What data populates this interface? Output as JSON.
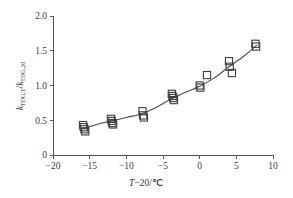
{
  "chart_data": {
    "type": "scatter",
    "title": "",
    "xlabel": "T-20/℃",
    "ylabel": "k(TDG,T) / k(TDG,20)",
    "ylabel_parts": {
      "k1": "k",
      "sub1": "TDG,T",
      "slash": "/",
      "k2": "k",
      "sub2": "TDG,20"
    },
    "xlabel_parts": {
      "var": "T",
      "rest": "−20/℃"
    },
    "xlim": [
      -20,
      10
    ],
    "ylim": [
      0,
      2.0
    ],
    "xticks": [
      -20,
      -15,
      -10,
      -5,
      0,
      5,
      10
    ],
    "xticklabels": [
      "−20",
      "−15",
      "−10",
      "−5",
      "0",
      "5",
      "10"
    ],
    "yticks": [
      0,
      0.5,
      1.0,
      1.5,
      2.0
    ],
    "yticklabels": [
      "0",
      "0.5",
      "1.0",
      "1.5",
      "2.0"
    ],
    "grid": false,
    "legend": null,
    "marker_style": "open-square",
    "series": [
      {
        "name": "measurements",
        "points": [
          [
            -15.9,
            0.43
          ],
          [
            -15.8,
            0.4
          ],
          [
            -15.7,
            0.37
          ],
          [
            -15.6,
            0.34
          ],
          [
            -12.1,
            0.52
          ],
          [
            -12.0,
            0.49
          ],
          [
            -11.9,
            0.46
          ],
          [
            -11.8,
            0.44
          ],
          [
            -7.8,
            0.63
          ],
          [
            -7.7,
            0.57
          ],
          [
            -7.6,
            0.54
          ],
          [
            -3.8,
            0.88
          ],
          [
            -3.7,
            0.85
          ],
          [
            -3.6,
            0.82
          ],
          [
            -3.5,
            0.79
          ],
          [
            0.0,
            1.0
          ],
          [
            0.1,
            0.97
          ],
          [
            1.0,
            1.15
          ],
          [
            4.0,
            1.35
          ],
          [
            4.1,
            1.27
          ],
          [
            4.4,
            1.18
          ],
          [
            7.6,
            1.6
          ],
          [
            7.7,
            1.56
          ]
        ]
      }
    ],
    "fit_curve": {
      "name": "fitted exponential trend",
      "points": [
        [
          -16.0,
          0.38
        ],
        [
          -14.0,
          0.44
        ],
        [
          -12.0,
          0.49
        ],
        [
          -10.0,
          0.54
        ],
        [
          -8.0,
          0.59
        ],
        [
          -6.0,
          0.68
        ],
        [
          -4.0,
          0.8
        ],
        [
          -2.0,
          0.9
        ],
        [
          0.0,
          0.99
        ],
        [
          2.0,
          1.11
        ],
        [
          4.0,
          1.27
        ],
        [
          6.0,
          1.42
        ],
        [
          7.8,
          1.58
        ]
      ]
    },
    "colors": {
      "axis": "#555555",
      "marker_edge": "#3d3d3d",
      "line": "#4a4a4a",
      "text": "#2e2e2e",
      "background": "#ffffff"
    }
  }
}
